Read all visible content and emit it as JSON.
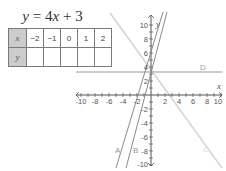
{
  "equation": {
    "lhs": "y",
    "eq": " = 4",
    "var": "x",
    "rhs": " + 3"
  },
  "table": {
    "row_x_label": "x",
    "row_y_label": "y",
    "x_values": [
      "−2",
      "−1",
      "0",
      "1",
      "2"
    ],
    "y_values": [
      "",
      "",
      "",
      "",
      ""
    ]
  },
  "graph": {
    "x_axis_label": "x",
    "y_axis_label": "y",
    "x_ticks": [
      "-10",
      "-8",
      "-6",
      "-4",
      "-2",
      "2",
      "4",
      "6",
      "8",
      "10"
    ],
    "y_ticks": [
      "10",
      "8",
      "6",
      "4",
      "2",
      "-2",
      "-4",
      "-6",
      "-8",
      "-10"
    ],
    "lines": [
      {
        "label": "A",
        "color": "#8a8a8a"
      },
      {
        "label": "B",
        "color": "#8a8a8a"
      },
      {
        "label": "C",
        "color": "#d0d0d0"
      },
      {
        "label": "D",
        "color": "#999999"
      }
    ]
  }
}
